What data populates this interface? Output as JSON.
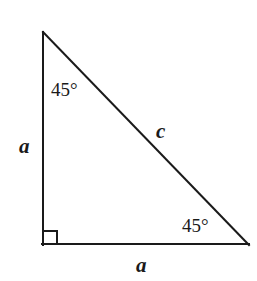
{
  "figure": {
    "name": "right-triangle-45-45-90",
    "background_color": "#ffffff",
    "stroke_color": "#1a1a1a",
    "text_color": "#1a1a1a",
    "width": 257,
    "height": 281
  },
  "geometry": {
    "vertices": {
      "top": {
        "x": 42,
        "y": 32
      },
      "bottom_left": {
        "x": 42,
        "y": 245
      },
      "bottom_right": {
        "x": 249,
        "y": 245
      }
    },
    "right_angle_marker": {
      "at": "bottom_left",
      "size": 14,
      "x": 42,
      "y": 231
    },
    "stroke_width": 2
  },
  "labels": {
    "angle_top": "45°",
    "angle_bottom_right": "45°",
    "side_left": "a",
    "side_bottom": "a",
    "side_hypotenuse": "c"
  }
}
